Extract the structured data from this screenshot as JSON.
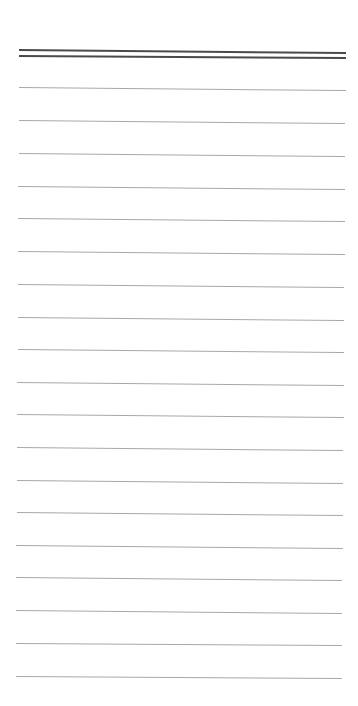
{
  "paper": {
    "background": "#ffffff",
    "header_lines": [
      {
        "x1": 19,
        "y1": 49,
        "x2": 346,
        "y2": 52,
        "color": "#4a4a4a"
      },
      {
        "x1": 19,
        "y1": 55,
        "x2": 346,
        "y2": 57,
        "color": "#4a4a4a"
      }
    ],
    "ruled_line_color": "#a8a8a8",
    "ruled_lines": [
      {
        "x1": 19,
        "y1": 87,
        "x2": 346,
        "y2": 90
      },
      {
        "x1": 19,
        "y1": 120,
        "x2": 345,
        "y2": 123
      },
      {
        "x1": 19,
        "y1": 153,
        "x2": 345,
        "y2": 156
      },
      {
        "x1": 18,
        "y1": 186,
        "x2": 345,
        "y2": 189
      },
      {
        "x1": 18,
        "y1": 218,
        "x2": 345,
        "y2": 221
      },
      {
        "x1": 18,
        "y1": 251,
        "x2": 345,
        "y2": 254
      },
      {
        "x1": 18,
        "y1": 284,
        "x2": 344,
        "y2": 287
      },
      {
        "x1": 18,
        "y1": 317,
        "x2": 344,
        "y2": 320
      },
      {
        "x1": 18,
        "y1": 349,
        "x2": 344,
        "y2": 352
      },
      {
        "x1": 17,
        "y1": 382,
        "x2": 344,
        "y2": 385
      },
      {
        "x1": 17,
        "y1": 414,
        "x2": 344,
        "y2": 417
      },
      {
        "x1": 17,
        "y1": 447,
        "x2": 343,
        "y2": 450
      },
      {
        "x1": 17,
        "y1": 480,
        "x2": 343,
        "y2": 483
      },
      {
        "x1": 17,
        "y1": 512,
        "x2": 343,
        "y2": 515
      },
      {
        "x1": 16,
        "y1": 545,
        "x2": 343,
        "y2": 548
      },
      {
        "x1": 16,
        "y1": 577,
        "x2": 342,
        "y2": 580
      },
      {
        "x1": 16,
        "y1": 610,
        "x2": 342,
        "y2": 613
      },
      {
        "x1": 16,
        "y1": 643,
        "x2": 342,
        "y2": 645
      },
      {
        "x1": 16,
        "y1": 676,
        "x2": 342,
        "y2": 678
      }
    ]
  }
}
